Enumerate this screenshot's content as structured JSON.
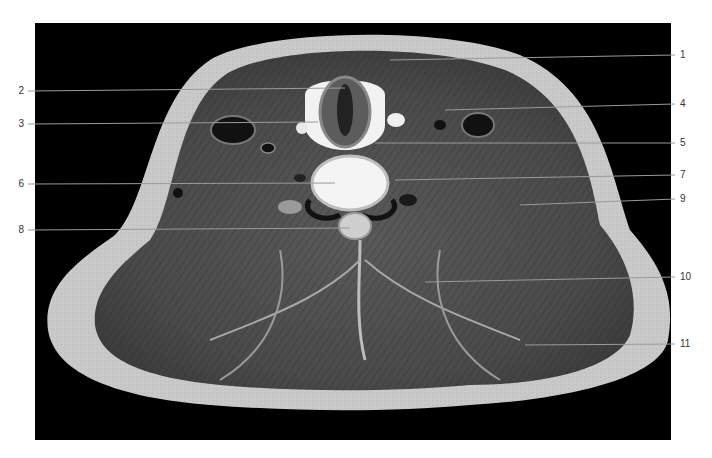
{
  "figure": {
    "type": "anatomical axial cross-section (neck)",
    "background_color": "#000000",
    "labels": [
      {
        "id": "1",
        "text": "1",
        "side": "right",
        "y": 55,
        "target": [
          390,
          60
        ]
      },
      {
        "id": "2",
        "text": "2",
        "side": "left",
        "y": 91,
        "target": [
          345,
          88
        ]
      },
      {
        "id": "3",
        "text": "3",
        "side": "left",
        "y": 124,
        "target": [
          318,
          122
        ]
      },
      {
        "id": "4",
        "text": "4",
        "side": "right",
        "y": 104,
        "target": [
          445,
          110
        ]
      },
      {
        "id": "5",
        "text": "5",
        "side": "right",
        "y": 143,
        "target": [
          375,
          143
        ]
      },
      {
        "id": "6",
        "text": "6",
        "side": "left",
        "y": 184,
        "target": [
          335,
          183
        ]
      },
      {
        "id": "7",
        "text": "7",
        "side": "right",
        "y": 175,
        "target": [
          395,
          180
        ]
      },
      {
        "id": "8",
        "text": "8",
        "side": "left",
        "y": 230,
        "target": [
          350,
          228
        ]
      },
      {
        "id": "9",
        "text": "9",
        "side": "right",
        "y": 199,
        "target": [
          520,
          205
        ]
      },
      {
        "id": "10",
        "text": "10",
        "side": "right",
        "y": 277,
        "target": [
          425,
          282
        ]
      },
      {
        "id": "11",
        "text": "11",
        "side": "right",
        "y": 344,
        "target": [
          525,
          345
        ]
      }
    ]
  }
}
